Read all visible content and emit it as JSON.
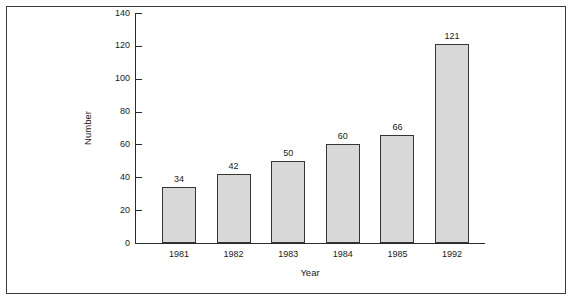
{
  "chart_data": {
    "type": "bar",
    "title": "",
    "subtitle": "",
    "xlabel": "Year",
    "ylabel": "Number",
    "categories": [
      "1981",
      "1982",
      "1983",
      "1984",
      "1985",
      "1992"
    ],
    "values": [
      34,
      42,
      50,
      60,
      66,
      121
    ],
    "data_labels": [
      "34",
      "42",
      "50",
      "60",
      "66",
      "121"
    ],
    "ylim": [
      0,
      140
    ],
    "yticks": [
      0,
      20,
      40,
      60,
      80,
      100,
      120,
      140
    ],
    "ytick_labels": [
      "0",
      "20",
      "40",
      "60",
      "80",
      "100",
      "120",
      "140"
    ],
    "grid": false,
    "legend": null,
    "legend_position": "none",
    "series": [
      {
        "name": "Number",
        "values": [
          34,
          42,
          50,
          60,
          66,
          121
        ]
      }
    ],
    "colors": {
      "bar_fill": "#d8d8d8",
      "bar_border": "#353535",
      "axis": "#2b2b2b",
      "text": "#1a1a1a",
      "frame": "#3a3a3a",
      "background": "#ffffff"
    }
  }
}
